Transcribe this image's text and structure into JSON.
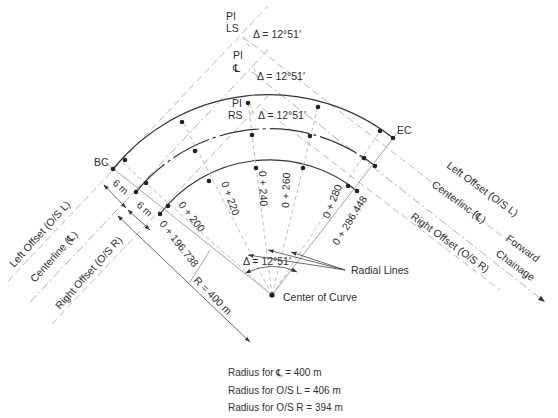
{
  "figure": {
    "pi_labels": [
      {
        "name": "PI",
        "sub": "LS",
        "delta": "Δ = 12°51′"
      },
      {
        "name": "PI",
        "sub": "℄",
        "delta": "Δ = 12°51′"
      },
      {
        "name": "PI",
        "sub": "RS",
        "delta": "Δ = 12°51′"
      }
    ],
    "points": {
      "bc": "BC",
      "ec": "EC",
      "center": "Center of Curve"
    },
    "offsets": {
      "left_width": "6 m",
      "right_width": "6 m"
    },
    "back_tangent_labels": {
      "left": "Left Offset (O/S L)",
      "centerline": "Centerline (℄)",
      "right": "Right Offset (O/S R)"
    },
    "forward_tangent_labels": {
      "left": "Left Offset (O/S L)",
      "centerline": "Centerlinc (℄)",
      "right": "Right Offset (O/S R)",
      "direction_1": "Forward",
      "direction_2": "Chainage"
    },
    "stations": [
      {
        "label": "0 + 196.738"
      },
      {
        "label": "0 + 200"
      },
      {
        "label": "0 + 220"
      },
      {
        "label": "0 + 240"
      },
      {
        "label": "0 + 260"
      },
      {
        "label": "0 + 280"
      },
      {
        "label": "0 + 286.448"
      }
    ],
    "radius_label": "R = 400 m",
    "central_angle": "Δ = 12°51′",
    "radial_lines_label": "Radial Lines",
    "notes": [
      "Radius for ℄ = 400 m",
      "Radius for O/S L = 406 m",
      "Radius for O/S R = 394 m"
    ]
  }
}
